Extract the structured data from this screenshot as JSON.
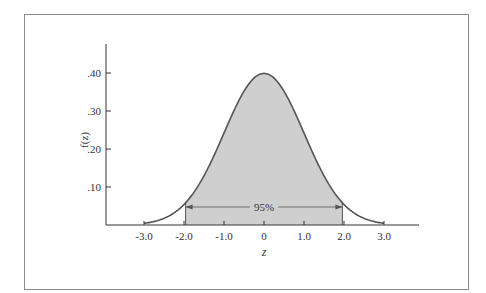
{
  "chart_data": {
    "type": "area",
    "title": "",
    "xlabel": "z",
    "ylabel": "f(z)",
    "x_ticks": [
      "-3.0",
      "-2.0",
      "-1.0",
      "0",
      "1.0",
      "2.0",
      "3.0"
    ],
    "x_tick_values": [
      -3,
      -2,
      -1,
      0,
      1,
      2,
      3
    ],
    "y_ticks": [
      ".10",
      ".20",
      ".30",
      ".40"
    ],
    "y_tick_values": [
      0.1,
      0.2,
      0.3,
      0.4
    ],
    "xlim": [
      -4.0,
      3.9
    ],
    "ylim": [
      0,
      0.46
    ],
    "grid": false,
    "series": [
      {
        "name": "Standard normal density",
        "function": "f(z) = (1/sqrt(2*pi)) * exp(-z^2/2)",
        "domain": [
          -3.0,
          3.0
        ]
      }
    ],
    "shaded_region": {
      "from": -1.96,
      "to": 1.96,
      "label": "95%"
    },
    "colors": {
      "curve": "#555555",
      "fill": "#cfcfcf",
      "axis": "#333333",
      "frame": "#8a8a8a"
    }
  }
}
